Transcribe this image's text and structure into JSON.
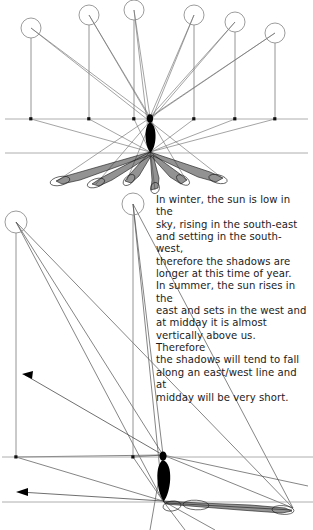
{
  "page": {
    "background_color": "#ffffff",
    "width": 313,
    "height": 530
  },
  "caption": {
    "name": "seasonal-shadow-explanation",
    "text": "In winter, the sun is low in the\nsky, rising in the south-east\nand setting in the south-west,\ntherefore the shadows are\nlonger at this time of year.\nIn summer, the sun rises in the\neast and sets in the west and\nat midday it is almost\nvertically above us. Therefore\nthe shadows will tend to fall\nalong an east/west line and at\nmidday will be very short.",
    "lines": [
      "In winter, the sun is low in the",
      "sky, rising in the south-east",
      "and setting in the south-west,",
      "therefore the shadows are",
      "longer at this time of year.",
      "In summer, the sun rises in the",
      "east and sets in the west and",
      "at midday it is almost",
      "vertically above us. Therefore",
      "the shadows will tend to fall",
      "along an east/west line and at",
      "midday will be very short."
    ]
  },
  "diagram_top": {
    "name": "summer-sun-radial-shadows",
    "description": "Six sun positions arranged in an arc above a standing figure, each casting a radial shadow outward.",
    "horizon_y": 119,
    "ground_y": 153,
    "figure": {
      "head_x": 150,
      "head_y": 117,
      "feet_x": 150,
      "feet_y": 152
    },
    "suns": [
      {
        "id": "sun-1",
        "cx": 31,
        "cy": 28,
        "r": 10,
        "base_x": 31,
        "base_y": 119
      },
      {
        "id": "sun-2",
        "cx": 89,
        "cy": 15,
        "r": 10,
        "base_x": 89,
        "base_y": 119
      },
      {
        "id": "sun-3",
        "cx": 134,
        "cy": 10,
        "r": 10,
        "base_x": 134,
        "base_y": 119
      },
      {
        "id": "sun-4",
        "cx": 194,
        "cy": 15,
        "r": 10,
        "base_x": 194,
        "base_y": 119
      },
      {
        "id": "sun-5",
        "cx": 235,
        "cy": 22,
        "r": 10,
        "base_x": 235,
        "base_y": 119
      },
      {
        "id": "sun-6",
        "cx": 275,
        "cy": 33,
        "r": 10,
        "base_x": 275,
        "base_y": 119
      }
    ],
    "shadow_tips": [
      {
        "id": "shadow-1",
        "x": 57,
        "y": 181
      },
      {
        "id": "shadow-2",
        "x": 96,
        "y": 184
      },
      {
        "id": "shadow-3",
        "x": 127,
        "y": 180
      },
      {
        "id": "shadow-4",
        "x": 155,
        "y": 190
      },
      {
        "id": "shadow-5",
        "x": 186,
        "y": 180
      },
      {
        "id": "shadow-6",
        "x": 222,
        "y": 178
      }
    ]
  },
  "diagram_bottom": {
    "name": "winter-low-sun-long-shadows",
    "description": "Two low sun positions on the left casting very long shadows to the right from a standing figure.",
    "horizon_y": 457,
    "ground_y": 502,
    "figure": {
      "head_x": 163,
      "head_y": 455,
      "feet_x": 163,
      "feet_y": 501
    },
    "suns": [
      {
        "id": "sun-low-1",
        "cx": 16,
        "cy": 222,
        "r": 11,
        "base_x": 16,
        "base_y": 457
      },
      {
        "id": "sun-low-2",
        "cx": 133,
        "cy": 204,
        "r": 11,
        "base_x": 133,
        "base_y": 457
      }
    ],
    "arrows": [
      {
        "id": "shadow-arrow-upper",
        "tip_x": 23,
        "tip_y": 375,
        "tail_x": 163,
        "tail_y": 455
      },
      {
        "id": "shadow-arrow-lower",
        "tip_x": 17,
        "tip_y": 492,
        "tail_x": 163,
        "tail_y": 501
      }
    ],
    "shadow_tip": {
      "x": 293,
      "y": 508
    }
  },
  "colors": {
    "ink": "#000000",
    "ray": "#6b6b6b",
    "horizon": "#9a9a9a",
    "text": "#1b1b1b",
    "background": "#ffffff"
  }
}
